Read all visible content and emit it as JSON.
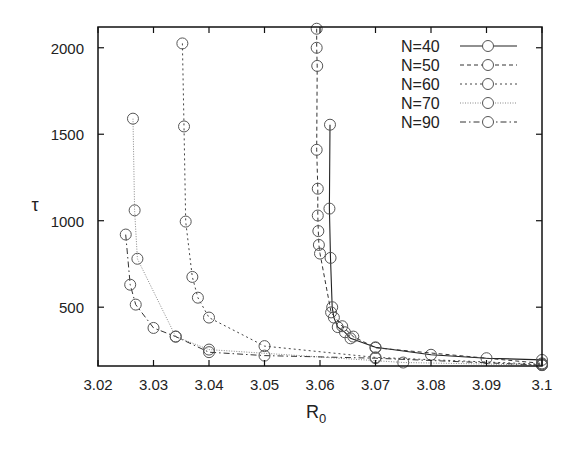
{
  "chart_data": {
    "type": "line",
    "title": "",
    "xlabel": "R",
    "xlabel_sub": "0",
    "ylabel": "τ",
    "xlim": [
      3.02,
      3.1
    ],
    "ylim": [
      160,
      2120
    ],
    "xticks": [
      3.02,
      3.03,
      3.04,
      3.05,
      3.06,
      3.07,
      3.08,
      3.09,
      3.1
    ],
    "xtick_labels": [
      "3.02",
      "3.03",
      "3.04",
      "3.05",
      "3.06",
      "3.07",
      "3.08",
      "3.09",
      "3.1"
    ],
    "yticks": [
      500,
      1000,
      1500,
      2000
    ],
    "ytick_labels": [
      "500",
      "1000",
      "1500",
      "2000"
    ],
    "grid": false,
    "legend_position": "top-right",
    "marker": "open-circle",
    "series": [
      {
        "name": "N=40",
        "line_style": "solid",
        "x": [
          3.0618,
          3.0617,
          3.0619,
          3.0622,
          3.0625,
          3.0632,
          3.0645,
          3.0655,
          3.07,
          3.08,
          3.09,
          3.1
        ],
        "y": [
          1555,
          1070,
          785,
          500,
          440,
          385,
          355,
          320,
          268,
          225,
          205,
          195
        ]
      },
      {
        "name": "N=50",
        "line_style": "dashed",
        "x": [
          3.0594,
          3.0594,
          3.0595,
          3.0594,
          3.0596,
          3.0596,
          3.0597,
          3.0598,
          3.06,
          3.062,
          3.064,
          3.066,
          3.07,
          3.1
        ],
        "y": [
          2110,
          2000,
          1895,
          1410,
          1185,
          1030,
          940,
          860,
          810,
          470,
          390,
          330,
          265,
          175
        ]
      },
      {
        "name": "N=60",
        "line_style": "dotted",
        "x": [
          3.0352,
          3.0355,
          3.0358,
          3.037,
          3.038,
          3.04,
          3.05,
          3.07,
          3.1
        ],
        "y": [
          2025,
          1545,
          995,
          675,
          555,
          440,
          275,
          210,
          170
        ]
      },
      {
        "name": "N=70",
        "line_style": "fine-dotted",
        "x": [
          3.0263,
          3.0266,
          3.0271,
          3.034,
          3.04,
          3.075,
          3.1
        ],
        "y": [
          1590,
          1060,
          780,
          330,
          255,
          180,
          165
        ]
      },
      {
        "name": "N=90",
        "line_style": "dash-dot",
        "x": [
          3.025,
          3.0258,
          3.0268,
          3.03,
          3.034,
          3.04,
          3.05,
          3.07,
          3.1
        ],
        "y": [
          920,
          630,
          515,
          380,
          330,
          240,
          220,
          205,
          165
        ]
      }
    ]
  }
}
